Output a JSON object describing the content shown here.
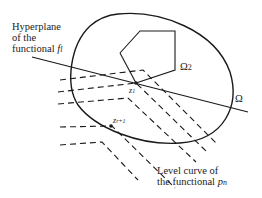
{
  "labels": {
    "hyperplane": [
      "Hyperplane",
      "of the",
      "functional"
    ],
    "hyperplane_symbol": "f",
    "hyperplane_sub": "l",
    "omega2": "Ω",
    "omega2_sub": "2",
    "omega": "Ω",
    "z1": "z",
    "z1_sub": "1",
    "zr": "z",
    "zr_sub": "r+1",
    "level_curve": [
      "Level curve of",
      "the functional"
    ],
    "level_symbol": "p",
    "level_sub": "n"
  },
  "colors": {
    "stroke": "#1a1a1a",
    "background": "#ffffff"
  }
}
